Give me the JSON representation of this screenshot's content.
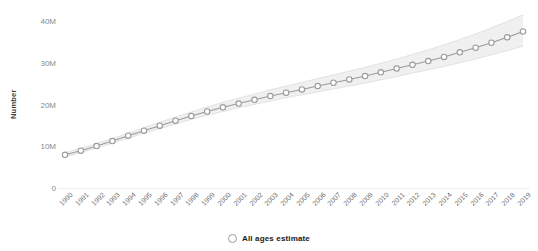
{
  "chart_data": {
    "type": "line",
    "title": "",
    "subtitle": "",
    "xlabel": "",
    "ylabel": "Number",
    "ylim": [
      0,
      42000000
    ],
    "xlim": [
      1990,
      2019
    ],
    "grid": false,
    "legend_position": "bottom-center",
    "y_ticks": [
      {
        "value": 0,
        "label": "0"
      },
      {
        "value": 10000000,
        "label": "10M"
      },
      {
        "value": 20000000,
        "label": "20M"
      },
      {
        "value": 30000000,
        "label": "30M"
      },
      {
        "value": 40000000,
        "label": "40M"
      }
    ],
    "categories": [
      "1990",
      "1991",
      "1992",
      "1993",
      "1994",
      "1995",
      "1996",
      "1997",
      "1998",
      "1999",
      "2000",
      "2001",
      "2002",
      "2003",
      "2004",
      "2005",
      "2006",
      "2007",
      "2008",
      "2009",
      "2010",
      "2011",
      "2012",
      "2013",
      "2014",
      "2015",
      "2016",
      "2017",
      "2018",
      "2019"
    ],
    "series": [
      {
        "name": "All ages estimate",
        "marker": "open-circle",
        "color": "#9b9b9b",
        "values": [
          8200000,
          9200000,
          10300000,
          11500000,
          12800000,
          14000000,
          15200000,
          16400000,
          17500000,
          18600000,
          19600000,
          20500000,
          21400000,
          22300000,
          23100000,
          23900000,
          24700000,
          25500000,
          26300000,
          27100000,
          28000000,
          28900000,
          29800000,
          30700000,
          31700000,
          32800000,
          33900000,
          35100000,
          36400000,
          37800000
        ],
        "uncertainty_band": {
          "name": "confidence interval",
          "color": "#cfcfcf",
          "lower": [
            7700000,
            8700000,
            9800000,
            11000000,
            12200000,
            13400000,
            14500000,
            15600000,
            16700000,
            17700000,
            18600000,
            19500000,
            20300000,
            21100000,
            21900000,
            22600000,
            23300000,
            24000000,
            24700000,
            25400000,
            26200000,
            27000000,
            27800000,
            28600000,
            29400000,
            30300000,
            31200000,
            32200000,
            33200000,
            34300000
          ],
          "upper": [
            8700000,
            9800000,
            10900000,
            12100000,
            13400000,
            14700000,
            16000000,
            17300000,
            18500000,
            19700000,
            20800000,
            21800000,
            22800000,
            23800000,
            24700000,
            25600000,
            26500000,
            27400000,
            28300000,
            29200000,
            30200000,
            31200000,
            32300000,
            33400000,
            34600000,
            35900000,
            37200000,
            38700000,
            40200000,
            41800000
          ]
        }
      }
    ]
  },
  "legend": {
    "items": [
      {
        "label": "All ages estimate",
        "marker": "open-circle"
      }
    ]
  },
  "axes": {
    "y_title": "Number"
  }
}
